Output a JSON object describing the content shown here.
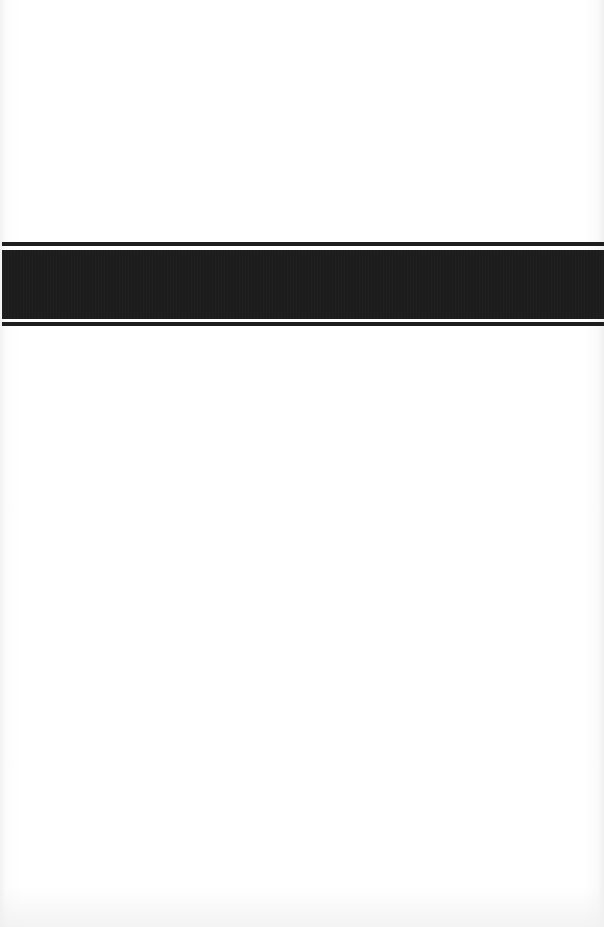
{
  "document": {
    "type": "scanned-page",
    "background_color": "#ffffff",
    "band": {
      "color": "#1c1c1c",
      "text": ""
    }
  }
}
